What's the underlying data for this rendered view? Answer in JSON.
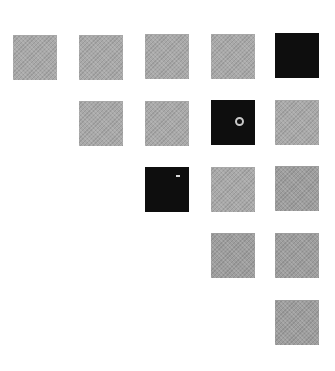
{
  "grid": {
    "description": "Upper-triangular 5x5 grid of squares",
    "colors": {
      "gray": "#a9a9a9",
      "gray_lower": "#9e9e9e",
      "dark": "#0e0e0e",
      "background": "#ffffff"
    },
    "rows": [
      [
        {
          "col": 1,
          "tone": "gray"
        },
        {
          "col": 2,
          "tone": "gray"
        },
        {
          "col": 3,
          "tone": "gray"
        },
        {
          "col": 4,
          "tone": "gray"
        },
        {
          "col": 5,
          "tone": "dark"
        }
      ],
      [
        {
          "col": 2,
          "tone": "gray"
        },
        {
          "col": 3,
          "tone": "gray"
        },
        {
          "col": 4,
          "tone": "dark",
          "mark": "ring"
        },
        {
          "col": 5,
          "tone": "gray"
        }
      ],
      [
        {
          "col": 3,
          "tone": "dark",
          "mark": "dash"
        },
        {
          "col": 4,
          "tone": "gray"
        },
        {
          "col": 5,
          "tone": "gray"
        }
      ],
      [
        {
          "col": 4,
          "tone": "gray"
        },
        {
          "col": 5,
          "tone": "gray"
        }
      ],
      [
        {
          "col": 5,
          "tone": "gray"
        }
      ]
    ]
  }
}
